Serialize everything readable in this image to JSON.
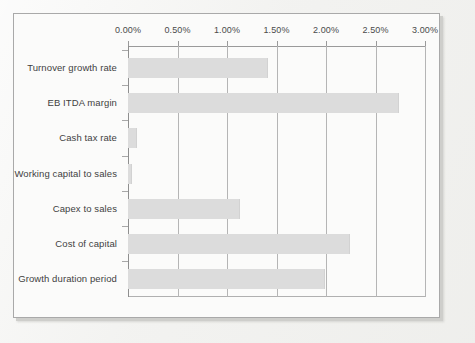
{
  "chart_data": {
    "type": "bar",
    "orientation": "horizontal",
    "title": "",
    "subtitle": "",
    "xlabel": "",
    "ylabel": "",
    "xlim": [
      0,
      3
    ],
    "xtick_labels": [
      "0.00%",
      "0.50%",
      "1.00%",
      "1.50%",
      "2.00%",
      "2.50%",
      "3.00%"
    ],
    "xtick_values": [
      0,
      0.5,
      1.0,
      1.5,
      2.0,
      2.5,
      3.0
    ],
    "grid": true,
    "legend": null,
    "categories": [
      "Turnover growth rate",
      "EB ITDA margin",
      "Cash tax rate",
      "Working capital to sales",
      "Capex to sales",
      "Cost of capital",
      "Growth duration period"
    ],
    "values": [
      1.41,
      2.74,
      0.09,
      0.04,
      1.13,
      2.24,
      1.99
    ],
    "value_labels": [
      "1.41%",
      "2.74%",
      "0.09%",
      "0.04%",
      "1.13%",
      "2.24%",
      "1.99%"
    ],
    "series": [
      {
        "name": "Sensitivity",
        "values": [
          1.41,
          2.74,
          0.09,
          0.04,
          1.13,
          2.24,
          1.99
        ]
      }
    ]
  },
  "style": {
    "bar_color": "#dcdcdc",
    "gridline_color": "#b5b5b5",
    "axis_color": "#9a9a9a",
    "plot_background": "#fbfbfa",
    "page_background": "#f2f2f0",
    "label_color": "#3f3f3f"
  }
}
